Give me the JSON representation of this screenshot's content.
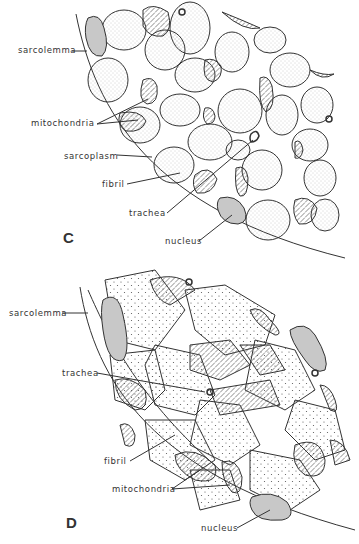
{
  "figure": {
    "panel_c": {
      "letter": "C",
      "labels": {
        "sarcolemma": "sarcolemma",
        "mitochondria": "mitochondria",
        "sarcoplasm": "sarcoplasm",
        "fibril": "fibril",
        "trachea": "trachea",
        "nucleus": "nucleus"
      }
    },
    "panel_d": {
      "letter": "D",
      "labels": {
        "sarcolemma": "sarcolemma",
        "trachea": "trachea",
        "fibril": "fibril",
        "mitochondria": "mitochondria",
        "nucleus": "nucleus"
      }
    },
    "colors": {
      "line": "#333333",
      "stipple": "#9a9a9a",
      "nucleus_fill": "#c8c8c8",
      "background": "#ffffff"
    }
  }
}
